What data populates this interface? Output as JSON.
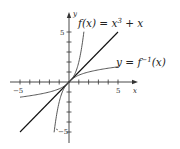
{
  "chart_data": {
    "type": "line",
    "title": "",
    "xlabel": "x",
    "ylabel": "y",
    "xlim": [
      -5,
      5
    ],
    "ylim": [
      -5,
      5
    ],
    "grid": false,
    "x_ticks": [
      -5,
      -4,
      -3,
      -2,
      -1,
      1,
      2,
      3,
      4,
      5
    ],
    "y_ticks": [
      -5,
      -4,
      -3,
      -2,
      -1,
      1,
      2,
      3,
      4,
      5
    ],
    "x_tick_labels": {
      "-5": "−5",
      "5": "5"
    },
    "y_tick_labels": {
      "5": "5",
      "-5": "−5"
    },
    "series": [
      {
        "name": "f(x) = x^3 + x",
        "label": "f(x) = x³ + x",
        "function": "x^3 + x",
        "x_range": [
          -1.52,
          1.52
        ],
        "color": "#444444"
      },
      {
        "name": "y = f^-1(x)",
        "label": "y = f⁻¹(x)",
        "function": "inverse of x^3 + x",
        "x_range": [
          -5,
          5
        ],
        "color": "#444444"
      },
      {
        "name": "y = x",
        "label": "",
        "function": "x",
        "x_range": [
          -5,
          5
        ],
        "color": "#111111"
      }
    ],
    "annotations": [
      {
        "text": "f(x) = x³ + x",
        "near": [
          1.8,
          5.5
        ]
      },
      {
        "text": "y = f⁻¹(x)",
        "near": [
          5.2,
          2
        ]
      }
    ]
  },
  "labels": {
    "x_axis": "x",
    "y_axis": "y",
    "x_min": "−5",
    "x_max": "5",
    "y_max": "5",
    "y_min": "−5",
    "f_label_pre": "f(x) = x",
    "f_label_sup": "3",
    "f_label_post": " + x",
    "inv_label_pre": "y = f",
    "inv_label_sup": "−1",
    "inv_label_post": "(x)"
  }
}
